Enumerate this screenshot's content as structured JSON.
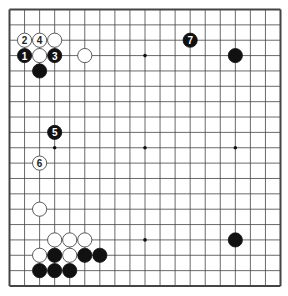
{
  "diagram": {
    "type": "go-board",
    "size": 19,
    "colors": {
      "background": "#ffffff",
      "line": "#444444",
      "black_stone": "#111111",
      "white_stone": "#ffffff",
      "stone_outline": "#333333"
    },
    "star_points": [
      [
        3,
        3
      ],
      [
        9,
        3
      ],
      [
        15,
        3
      ],
      [
        3,
        9
      ],
      [
        9,
        9
      ],
      [
        15,
        9
      ],
      [
        3,
        15
      ],
      [
        9,
        15
      ],
      [
        15,
        15
      ]
    ],
    "stones": [
      {
        "color": "black",
        "col": 1,
        "row": 3,
        "label": "1"
      },
      {
        "color": "white",
        "col": 1,
        "row": 2,
        "label": "2"
      },
      {
        "color": "black",
        "col": 3,
        "row": 3,
        "label": "3"
      },
      {
        "color": "white",
        "col": 2,
        "row": 2,
        "label": "4"
      },
      {
        "color": "black",
        "col": 3,
        "row": 8,
        "label": "5"
      },
      {
        "color": "white",
        "col": 2,
        "row": 10,
        "label": "6"
      },
      {
        "color": "black",
        "col": 12,
        "row": 2,
        "label": "7"
      },
      {
        "color": "white",
        "col": 3,
        "row": 2,
        "label": ""
      },
      {
        "color": "white",
        "col": 2,
        "row": 3,
        "label": ""
      },
      {
        "color": "white",
        "col": 5,
        "row": 3,
        "label": ""
      },
      {
        "color": "black",
        "col": 2,
        "row": 4,
        "label": ""
      },
      {
        "color": "black",
        "col": 15,
        "row": 3,
        "label": ""
      },
      {
        "color": "white",
        "col": 2,
        "row": 13,
        "label": ""
      },
      {
        "color": "white",
        "col": 3,
        "row": 15,
        "label": ""
      },
      {
        "color": "white",
        "col": 4,
        "row": 15,
        "label": ""
      },
      {
        "color": "white",
        "col": 5,
        "row": 15,
        "label": ""
      },
      {
        "color": "black",
        "col": 15,
        "row": 15,
        "label": ""
      },
      {
        "color": "white",
        "col": 2,
        "row": 16,
        "label": ""
      },
      {
        "color": "black",
        "col": 3,
        "row": 16,
        "label": ""
      },
      {
        "color": "white",
        "col": 4,
        "row": 16,
        "label": ""
      },
      {
        "color": "black",
        "col": 5,
        "row": 16,
        "label": ""
      },
      {
        "color": "black",
        "col": 6,
        "row": 16,
        "label": ""
      },
      {
        "color": "black",
        "col": 2,
        "row": 17,
        "label": ""
      },
      {
        "color": "black",
        "col": 3,
        "row": 17,
        "label": ""
      },
      {
        "color": "black",
        "col": 4,
        "row": 17,
        "label": ""
      }
    ]
  }
}
